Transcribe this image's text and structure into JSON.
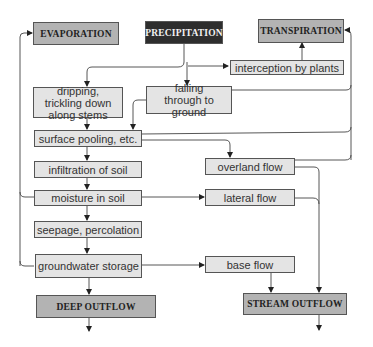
{
  "diagram": {
    "nodes": {
      "evaporation": "EVAPORATION",
      "precipitation": "PRECIPITATION",
      "transpiration": "TRANSPIRATION",
      "interception": "interception by plants",
      "dripping": "dripping, trickling down along stems",
      "falling": "falling through to ground",
      "surface_pooling": "surface pooling, etc.",
      "overland_flow": "overland flow",
      "infiltration": "infiltration of soil",
      "moisture": "moisture in soil",
      "lateral_flow": "lateral flow",
      "seepage": "seepage, percolation",
      "groundwater": "groundwater storage",
      "base_flow": "base flow",
      "deep_outflow": "DEEP OUTFLOW",
      "stream_outflow": "STREAM OUTFLOW"
    },
    "edges": [
      {
        "from": "PRECIPITATION",
        "to": "dripping, trickling down along stems"
      },
      {
        "from": "PRECIPITATION",
        "to": "falling through to ground"
      },
      {
        "from": "PRECIPITATION",
        "to": "interception by plants"
      },
      {
        "from": "interception by plants",
        "to": "TRANSPIRATION"
      },
      {
        "from": "dripping, trickling down along stems",
        "to": "surface pooling, etc."
      },
      {
        "from": "falling through to ground",
        "to": "surface pooling, etc."
      },
      {
        "from": "falling through to ground",
        "to": "TRANSPIRATION"
      },
      {
        "from": "surface pooling, etc.",
        "to": "TRANSPIRATION"
      },
      {
        "from": "surface pooling, etc.",
        "to": "overland flow"
      },
      {
        "from": "surface pooling, etc.",
        "to": "infiltration of soil"
      },
      {
        "from": "overland flow",
        "to": "TRANSPIRATION"
      },
      {
        "from": "overland flow",
        "to": "STREAM OUTFLOW"
      },
      {
        "from": "infiltration of soil",
        "to": "moisture in soil"
      },
      {
        "from": "moisture in soil",
        "to": "EVAPORATION"
      },
      {
        "from": "moisture in soil",
        "to": "lateral flow"
      },
      {
        "from": "moisture in soil",
        "to": "seepage, percolation"
      },
      {
        "from": "lateral flow",
        "to": "STREAM OUTFLOW"
      },
      {
        "from": "seepage, percolation",
        "to": "groundwater storage"
      },
      {
        "from": "groundwater storage",
        "to": "EVAPORATION"
      },
      {
        "from": "groundwater storage",
        "to": "base flow"
      },
      {
        "from": "groundwater storage",
        "to": "DEEP OUTFLOW"
      },
      {
        "from": "base flow",
        "to": "STREAM OUTFLOW"
      }
    ],
    "colors": {
      "major_box": "#b3b3b3",
      "dark_box": "#2e2e2e",
      "minor_box": "#e4e4e4",
      "line": "#444444"
    }
  }
}
